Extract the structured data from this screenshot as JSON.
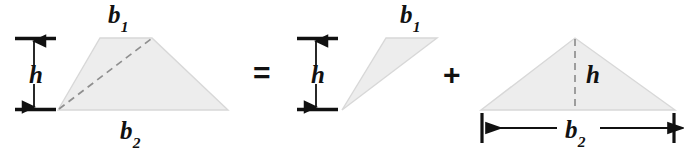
{
  "figure": {
    "fill_color": "#ededed",
    "edge_color": "#d6d6d6",
    "ink_color": "#111111",
    "dash_color": "#8a8a8a"
  },
  "operators": {
    "equals": "=",
    "plus": "+"
  },
  "labels": {
    "b_base": "b",
    "b1_sub": "1",
    "b2_sub": "2",
    "h": "h"
  },
  "shapes": [
    {
      "name": "trapezoid",
      "type": "trapezoid",
      "vertices": [
        [
          58,
          110
        ],
        [
          100,
          38
        ],
        [
          152,
          38
        ],
        [
          228,
          110
        ]
      ],
      "annotations": [
        "b1-top",
        "b2-bottom",
        "h-left-bracket",
        "dashed-diagonal"
      ]
    },
    {
      "name": "thin-triangle",
      "type": "triangle",
      "vertices": [
        [
          342,
          110
        ],
        [
          386,
          38
        ],
        [
          437,
          38
        ]
      ],
      "annotations": [
        "b1-top",
        "h-left-bracket"
      ]
    },
    {
      "name": "wide-triangle",
      "type": "triangle",
      "vertices": [
        [
          481,
          110
        ],
        [
          575,
          38
        ],
        [
          675,
          110
        ]
      ],
      "annotations": [
        "h-dashed-altitude",
        "b2-dimension-line"
      ]
    }
  ],
  "dimensions": [
    {
      "name": "h-bracket-left",
      "label": "h",
      "orientation": "vertical",
      "from": [
        33,
        38
      ],
      "to": [
        33,
        110
      ]
    },
    {
      "name": "h-bracket-middle",
      "label": "h",
      "orientation": "vertical",
      "from": [
        315,
        38
      ],
      "to": [
        315,
        110
      ]
    },
    {
      "name": "h-altitude-right",
      "label": "h",
      "orientation": "vertical",
      "from": [
        575,
        38
      ],
      "to": [
        575,
        110
      ]
    },
    {
      "name": "b2-dimension",
      "label": "b2",
      "orientation": "horizontal",
      "from": [
        481,
        128
      ],
      "to": [
        675,
        128
      ]
    }
  ]
}
